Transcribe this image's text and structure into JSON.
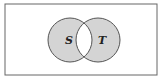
{
  "diagram": {
    "type": "venn",
    "universe": {
      "label": ""
    },
    "sets": [
      {
        "id": "S",
        "label": "S"
      },
      {
        "id": "T",
        "label": "T"
      }
    ],
    "shaded_region": "symmetric difference (S ∪ T minus S ∩ T)",
    "colors": {
      "shade": "#d4d4d4",
      "stroke": "#555555",
      "border": "#666666"
    }
  }
}
